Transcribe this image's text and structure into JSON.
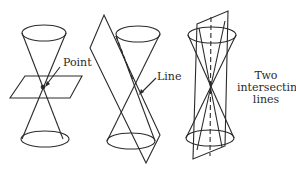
{
  "figure": {
    "panels": [
      {
        "id": "point",
        "label": "Point",
        "description": "Plane through apex perpendicular to axis"
      },
      {
        "id": "line",
        "label": "Line",
        "description": "Plane tangent to cone along a generator"
      },
      {
        "id": "two-lines",
        "label_lines": [
          "Two",
          "intersecting",
          "lines"
        ],
        "description": "Plane through axis"
      }
    ]
  },
  "colors": {
    "stroke": "#2a2a2a",
    "background": "#ffffff"
  }
}
